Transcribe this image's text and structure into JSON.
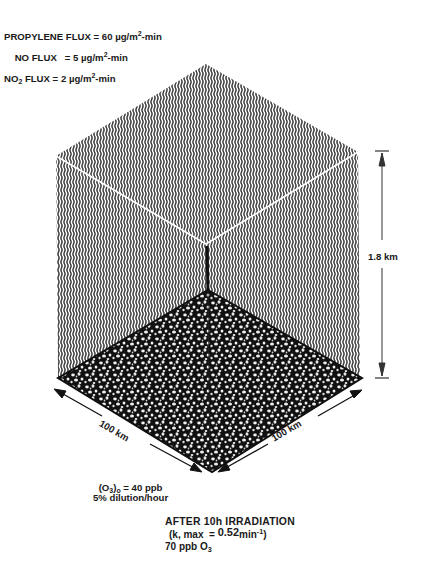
{
  "flux": {
    "propylene": {
      "label": "PROPYLENE FLUX",
      "eq": " = 60 ",
      "unit": "µg/m",
      "exp": "2",
      "suffix": "-min"
    },
    "no": {
      "label": "NO FLUX",
      "eq": "   = 5 ",
      "unit": "µg/m",
      "exp": "2",
      "suffix": "-min"
    },
    "no2": {
      "label_pre": "NO",
      "label_sub": "2",
      "label_post": " FLUX",
      "eq": " = 2 ",
      "unit": "µg/m",
      "exp": "2",
      "suffix": "-min"
    }
  },
  "box": {
    "height_label": "1.8 km",
    "width_left_label": "100 km",
    "width_right_label": "100 km",
    "wall_color": "#3a3a3a",
    "edge_color": "#ffffff",
    "floor_color": "#111111"
  },
  "initial": {
    "o3_pre": "(O",
    "o3_sub": "3",
    "o3_post": ")",
    "o3_zero": "o",
    "o3_value": " = 40 ppb",
    "dilution": "5% dilution/hour"
  },
  "result": {
    "title": "AFTER 10h IRRADIATION",
    "k_pre": "(k, max  = ",
    "k_val": "0.52",
    "k_unit": "min",
    "k_exp": "-1",
    "k_post": ")",
    "o3_text": "70 ppb O",
    "o3_sub": "3"
  }
}
